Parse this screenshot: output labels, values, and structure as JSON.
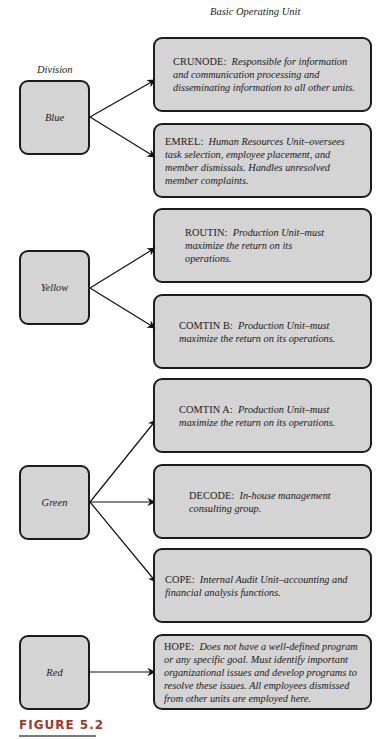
{
  "headers": {
    "division": "Division",
    "basic_operating_unit": "Basic Operating Unit"
  },
  "divisions": [
    {
      "label": "Blue"
    },
    {
      "label": "Yellow"
    },
    {
      "label": "Green"
    },
    {
      "label": "Red"
    }
  ],
  "units": [
    {
      "code": "CRUNODE:",
      "description": "Responsible for information and communication processing and disseminating information to all other units.",
      "division": "Blue"
    },
    {
      "code": "EMREL:",
      "description": "Human Resources Unit–oversees task selection, employee placement, and member dismissals. Handles unresolved member complaints.",
      "division": "Blue"
    },
    {
      "code": "ROUTIN:",
      "description": "Production Unit–must maximize the return on its operations.",
      "division": "Yellow"
    },
    {
      "code": "COMTIN B:",
      "description": "Production Unit–must maximize the return on its operations.",
      "division": "Yellow"
    },
    {
      "code": "COMTIN A:",
      "description": "Production Unit–must maximize the return on its operations.",
      "division": "Green"
    },
    {
      "code": "DECODE:",
      "description": "In-house management consulting group.",
      "division": "Green"
    },
    {
      "code": "COPE:",
      "description": "Internal Audit Unit–accounting and financial analysis functions.",
      "division": "Green"
    },
    {
      "code": "HOPE:",
      "description": "Does not have a well-defined program or any specific goal. Must identify important organizational issues and develop programs to resolve these issues. All employees dismissed from other units are employed here.",
      "division": "Red"
    }
  ],
  "figure": {
    "caption": "FIGURE 5.2"
  },
  "colors": {
    "box_fill": "#d4d4d4",
    "box_border": "#1c1c1c",
    "caption": "#9a3b2e"
  }
}
